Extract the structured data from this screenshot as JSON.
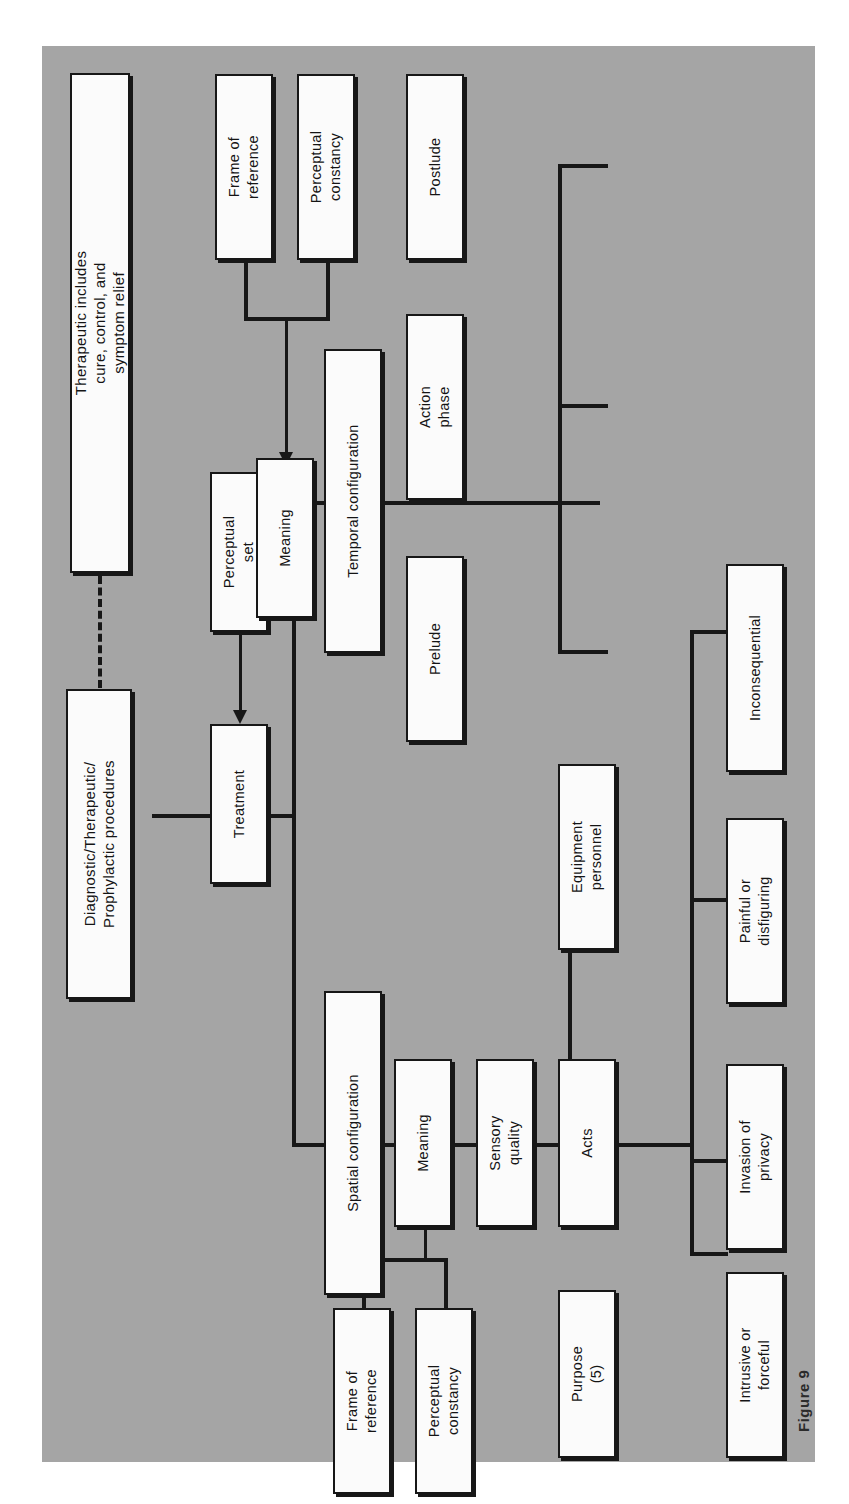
{
  "figure": {
    "caption": "Figure 9"
  },
  "colors": {
    "plate_background": "#a5a5a5",
    "node_fill": "#fbfbfb",
    "line": "#171717",
    "page_background": "#ffffff"
  },
  "diagram": {
    "orientation": "rotated-90-counterclockwise",
    "nodes": {
      "therapeutic_note": "Therapeutic includes\ncure, control, and\nsymptom relief",
      "therapeutic_note_l1": "Therapeutic includes",
      "therapeutic_note_l2": "cure, control, and",
      "therapeutic_note_l3": "symptom relief",
      "procedures_l1": "Diagnostic/Therapeutic/",
      "procedures_l2": "Prophylactic procedures",
      "perceptual_set_l1": "Perceptual",
      "perceptual_set_l2": "set",
      "treatment": "Treatment",
      "temporal_configuration": "Temporal configuration",
      "spatial_configuration": "Spatial configuration",
      "frame_of_reference_top_l1": "Frame of",
      "frame_of_reference_top_l2": "reference",
      "perceptual_constancy_top_l1": "Perceptual",
      "perceptual_constancy_top_l2": "constancy",
      "frame_of_reference_bottom_l1": "Frame of",
      "frame_of_reference_bottom_l2": "reference",
      "perceptual_constancy_bottom_l1": "Perceptual",
      "perceptual_constancy_bottom_l2": "constancy",
      "meaning_top": "Meaning",
      "meaning_bottom": "Meaning",
      "sensory_quality_l1": "Sensory",
      "sensory_quality_l2": "quality",
      "postlude": "Postlude",
      "action_phase_l1": "Action",
      "action_phase_l2": "phase",
      "prelude": "Prelude",
      "equipment_personnel_l1": "Equipment",
      "equipment_personnel_l2": "personnel",
      "acts": "Acts",
      "purpose_l1": "Purpose",
      "purpose_l2": "(5)",
      "inconsequential": "Inconsequential",
      "painful_or_disfiguring_l1": "Painful or",
      "painful_or_disfiguring_l2": "disfiguring",
      "invasion_of_privacy_l1": "Invasion of",
      "invasion_of_privacy_l2": "privacy",
      "intrusive_or_forceful_l1": "Intrusive or",
      "intrusive_or_forceful_l2": "forceful"
    }
  }
}
